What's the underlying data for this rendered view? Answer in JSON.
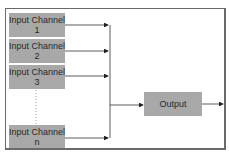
{
  "diagram": {
    "inputs": [
      {
        "line1": "Input Channel",
        "line2": "1"
      },
      {
        "line1": "Input Channel",
        "line2": "2"
      },
      {
        "line1": "Input Channel",
        "line2": "3"
      },
      {
        "line1": "Input Channel",
        "line2": "n"
      }
    ],
    "output": {
      "label": "Output"
    },
    "colors": {
      "box_fill": "#a8a8a8",
      "line": "#333333",
      "frame": "#6a6a6a"
    }
  }
}
